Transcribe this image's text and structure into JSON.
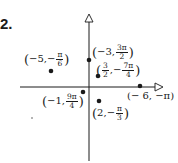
{
  "problem_number": "2.",
  "axes": {
    "origin_px": [
      89,
      87
    ],
    "horizontal_arrow": "right",
    "vertical_arrow": "up"
  },
  "points": [
    {
      "r": "−5",
      "theta_num": "π",
      "theta_den": "6",
      "theta_sign": "−",
      "dot": [
        51,
        71
      ],
      "label_pos": [
        24,
        52
      ]
    },
    {
      "r": "−3",
      "theta_num": "3π",
      "theta_den": "2",
      "theta_sign": "",
      "dot": [
        89,
        60
      ],
      "label_pos": [
        92,
        45
      ]
    },
    {
      "r_num": "3",
      "r_den": "2",
      "theta_num": "7π",
      "theta_den": "4",
      "theta_sign": "−",
      "dot": [
        98,
        75
      ],
      "label_pos": [
        96,
        63
      ]
    },
    {
      "r": "−6",
      "theta": "π",
      "theta_sign": "−",
      "dot": [
        140,
        86
      ],
      "label_pos": [
        127,
        90
      ]
    },
    {
      "r": "−1",
      "theta_num": "9π",
      "theta_den": "4",
      "theta_sign": "",
      "dot": [
        83,
        92
      ],
      "label_pos": [
        42,
        94
      ]
    },
    {
      "r": "2",
      "theta_num": "π",
      "theta_den": "3",
      "theta_sign": "−",
      "dot": [
        99,
        101
      ],
      "label_pos": [
        92,
        105
      ]
    }
  ],
  "text": {
    "open": "(",
    "close": ")",
    "comma": ", ",
    "p1_r": "−5",
    "p1_sign": "−",
    "p1_num": "π",
    "p1_den": "6",
    "p2_r": "−3",
    "p2_num": "3π",
    "p2_den": "2",
    "p3_rnum": "3",
    "p3_rden": "2",
    "p3_sign": "−",
    "p3_num": "7π",
    "p3_den": "4",
    "p4_text": "(− 6, −π)",
    "p5_r": "−1",
    "p5_num": "9π",
    "p5_den": "4",
    "p6_r": "2",
    "p6_sign": "−",
    "p6_num": "π",
    "p6_den": "3"
  },
  "colors": {
    "ink": "#1a1a1a",
    "background": "#ffffff"
  }
}
